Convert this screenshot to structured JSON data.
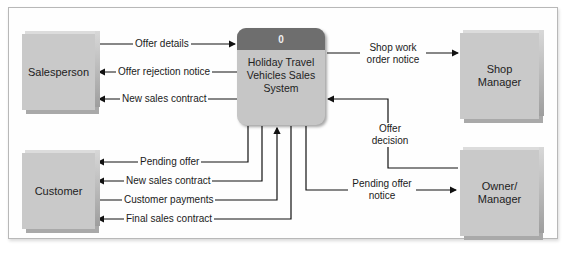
{
  "diagram": {
    "type": "context-diagram",
    "process": {
      "number": "0",
      "name": "Holiday Travel Vehicles Sales System"
    },
    "entities": {
      "salesperson": "Salesperson",
      "customer": "Customer",
      "shop_manager": "Shop Manager",
      "owner_manager": "Owner/ Manager"
    },
    "flows": {
      "offer_details": "Offer details",
      "offer_rejection_notice": "Offer rejection notice",
      "new_sales_contract_sp": "New sales contract",
      "shop_work_order_notice": "Shop work order notice",
      "offer_decision": "Offer decision",
      "pending_offer_notice": "Pending offer notice",
      "pending_offer": "Pending offer",
      "new_sales_contract_cust": "New sales contract",
      "customer_payments": "Customer payments",
      "final_sales_contract": "Final sales contract"
    }
  }
}
